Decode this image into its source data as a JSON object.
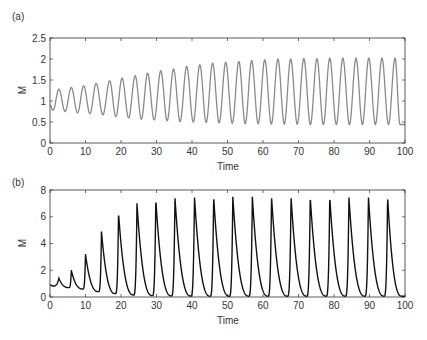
{
  "chart_data": [
    {
      "panel_label": "(a)",
      "type": "line",
      "xlabel": "Time",
      "ylabel": "M",
      "xlim": [
        0,
        100
      ],
      "ylim": [
        0,
        2.5
      ],
      "xticks": [
        0,
        10,
        20,
        30,
        40,
        50,
        60,
        70,
        80,
        90,
        100
      ],
      "yticks": [
        "0",
        "0.5",
        "1",
        "1.5",
        "2",
        "2.5"
      ],
      "grid": false,
      "line_color": "#8a8a8a",
      "period": 3.65,
      "start_value": 0.9,
      "peaks": {
        "t": [
          2.5,
          6,
          9.5,
          13,
          16.8,
          20.3,
          24,
          27.5,
          31.2,
          34.8,
          38.5,
          42.2,
          45.8,
          49.5,
          53.2,
          56.8,
          60.5,
          64.2,
          67.8,
          71.5,
          75.2,
          78.8,
          82.5,
          86.2,
          89.8,
          93.5,
          97.2
        ],
        "values": [
          1.28,
          1.32,
          1.36,
          1.42,
          1.48,
          1.54,
          1.6,
          1.66,
          1.72,
          1.76,
          1.82,
          1.86,
          1.9,
          1.92,
          1.94,
          1.96,
          1.98,
          2.0,
          2.0,
          2.01,
          2.01,
          2.02,
          2.02,
          2.02,
          2.02,
          2.02,
          2.02
        ]
      },
      "troughs": {
        "values": [
          0.75,
          0.72,
          0.7,
          0.67,
          0.63,
          0.6,
          0.57,
          0.55,
          0.53,
          0.51,
          0.5,
          0.49,
          0.48,
          0.47,
          0.46,
          0.46,
          0.45,
          0.45,
          0.45,
          0.44,
          0.44,
          0.44,
          0.44,
          0.44,
          0.44,
          0.44,
          0.44
        ]
      }
    },
    {
      "panel_label": "(b)",
      "type": "line",
      "xlabel": "Time",
      "ylabel": "M",
      "xlim": [
        0,
        100
      ],
      "ylim": [
        0,
        8
      ],
      "xticks": [
        0,
        10,
        20,
        30,
        40,
        50,
        60,
        70,
        80,
        90,
        100
      ],
      "yticks": [
        "0",
        "2",
        "4",
        "6",
        "8"
      ],
      "grid": false,
      "line_color": "#111111",
      "start_value": 0.9,
      "peaks": {
        "t": [
          2.5,
          6,
          10,
          14.5,
          19.3,
          24.5,
          29.8,
          35.2,
          40.7,
          46.1,
          51.5,
          57,
          62.4,
          67.9,
          73.3,
          78.8,
          84.2,
          89.7,
          95.1
        ],
        "values": [
          1.4,
          2.0,
          3.2,
          4.9,
          6.3,
          7.0,
          7.3,
          7.45,
          7.5,
          7.5,
          7.5,
          7.5,
          7.5,
          7.5,
          7.5,
          7.5,
          7.5,
          7.5,
          7.5
        ]
      },
      "troughs": {
        "values": [
          0.7,
          0.6,
          0.4,
          0.25,
          0.15,
          0.1,
          0.08,
          0.07,
          0.06,
          0.06,
          0.06,
          0.06,
          0.06,
          0.06,
          0.06,
          0.06,
          0.06,
          0.06,
          0.06
        ]
      }
    }
  ]
}
